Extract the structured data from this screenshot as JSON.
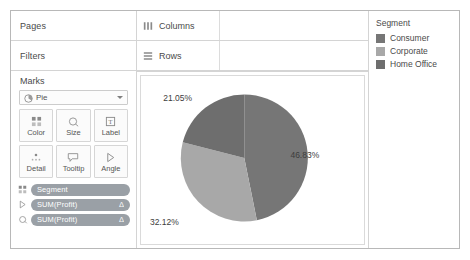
{
  "left_panel": {
    "pages_label": "Pages",
    "filters_label": "Filters",
    "marks_label": "Marks",
    "mark_type": {
      "value": "Pie",
      "icon": "pie-icon"
    },
    "buttons": [
      {
        "label": "Color",
        "icon": "color-icon"
      },
      {
        "label": "Size",
        "icon": "size-icon"
      },
      {
        "label": "Label",
        "icon": "label-icon"
      },
      {
        "label": "Detail",
        "icon": "detail-icon"
      },
      {
        "label": "Tooltip",
        "icon": "tooltip-icon"
      },
      {
        "label": "Angle",
        "icon": "angle-icon"
      }
    ],
    "pills": [
      {
        "text": "Segment",
        "delta": "",
        "icon": "color-icon"
      },
      {
        "text": "SUM(Profit)",
        "delta": "Δ",
        "icon": "angle-icon"
      },
      {
        "text": "SUM(Profit)",
        "delta": "Δ",
        "icon": "label-icon"
      }
    ]
  },
  "shelves": {
    "columns_label": "Columns",
    "columns_icon": "columns-icon",
    "rows_label": "Rows",
    "rows_icon": "rows-icon"
  },
  "legend": {
    "title": "Segment",
    "items": [
      {
        "label": "Consumer",
        "color": "#767676"
      },
      {
        "label": "Corporate",
        "color": "#a8a8a8"
      },
      {
        "label": "Home Office",
        "color": "#6e6e6e"
      }
    ]
  },
  "chart_data": {
    "type": "pie",
    "title": "",
    "labels": [
      "Consumer",
      "Corporate",
      "Home Office"
    ],
    "values": [
      46.83,
      32.12,
      21.05
    ],
    "value_labels": [
      "46.83%",
      "32.12%",
      "21.05%"
    ],
    "colors": [
      "#767676",
      "#a8a8a8",
      "#6e6e6e"
    ],
    "start_angle_deg": 0,
    "direction": "clockwise",
    "legend_position": "right",
    "grid": false,
    "slices": [
      {
        "label": "Consumer",
        "value": 46.83,
        "display": "46.83%",
        "color": "#767676",
        "start_deg": 0.0,
        "end_deg": 168.6
      },
      {
        "label": "Corporate",
        "value": 32.12,
        "display": "32.12%",
        "color": "#a8a8a8",
        "start_deg": 168.6,
        "end_deg": 284.2
      },
      {
        "label": "Home Office",
        "value": 21.05,
        "display": "21.05%",
        "color": "#6e6e6e",
        "start_deg": 284.2,
        "end_deg": 360.0
      }
    ]
  }
}
